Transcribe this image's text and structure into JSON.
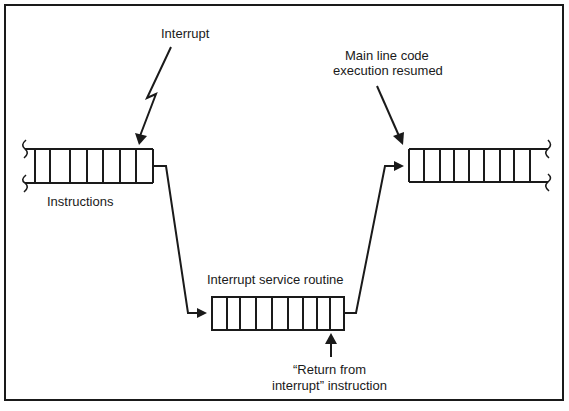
{
  "diagram": {
    "labels": {
      "interrupt": "Interrupt",
      "instructions": "Instructions",
      "resumed_line1": "Main line code",
      "resumed_line2": "execution resumed",
      "isr": "Interrupt service routine",
      "return_line1": "“Return from",
      "return_line2": "interrupt” instruction"
    },
    "nodes": [
      {
        "id": "main-instructions",
        "label": "Instructions",
        "cells": 8
      },
      {
        "id": "interrupt-service-routine",
        "label": "Interrupt service routine",
        "cells": 9
      },
      {
        "id": "main-resumed",
        "label": "Main line code execution resumed",
        "cells": 9
      }
    ],
    "edges": [
      {
        "from": "main-instructions",
        "to": "interrupt-service-routine"
      },
      {
        "from": "interrupt-service-routine",
        "to": "main-resumed"
      }
    ],
    "colors": {
      "ink": "#1a1a1a",
      "background": "#ffffff"
    }
  }
}
